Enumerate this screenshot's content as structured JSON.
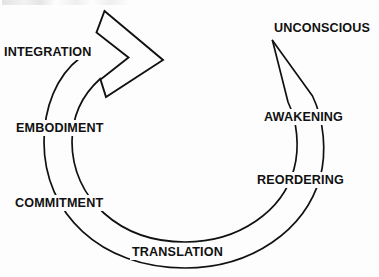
{
  "diagram": {
    "type": "cyclical-process-diagram",
    "title": "",
    "stroke_color": "#111111",
    "background_color": "#fdfdfd",
    "direction": "clockwise",
    "nodes": [
      {
        "id": "unconscious",
        "label": "UNCONSCIOUS",
        "position": "top-right"
      },
      {
        "id": "awakening",
        "label": "AWAKENING",
        "position": "right-upper"
      },
      {
        "id": "reordering",
        "label": "REORDERING",
        "position": "right-lower"
      },
      {
        "id": "translation",
        "label": "TRANSLATION",
        "position": "bottom"
      },
      {
        "id": "commitment",
        "label": "COMMITMENT",
        "position": "left-lower"
      },
      {
        "id": "embodiment",
        "label": "EMBODIMENT",
        "position": "left-middle"
      },
      {
        "id": "integration",
        "label": "INTEGRATION",
        "position": "top-left"
      }
    ],
    "arrow": {
      "name": "cycle-arrow",
      "shape": "chevron",
      "direction": "right"
    }
  }
}
